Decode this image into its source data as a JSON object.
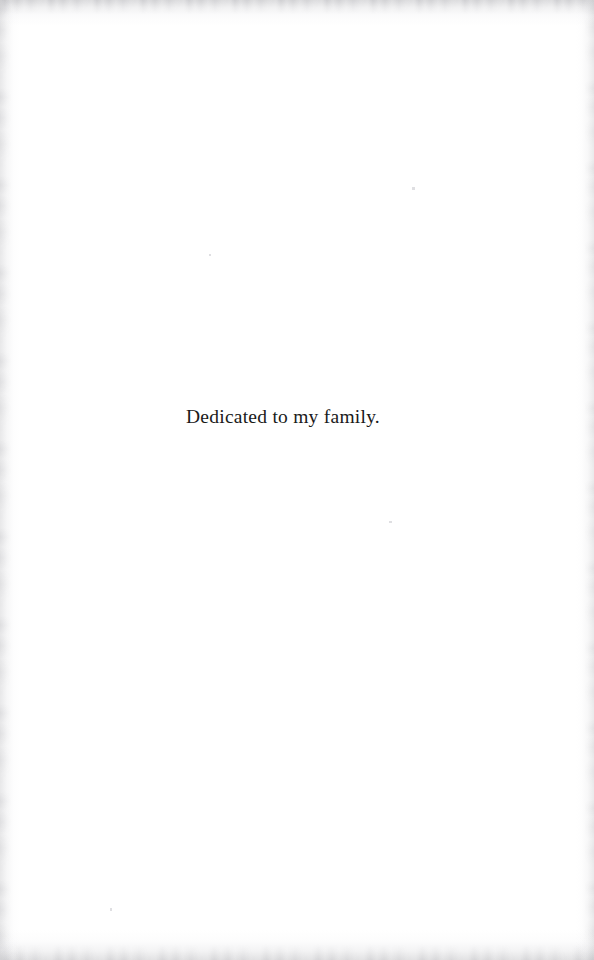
{
  "document": {
    "page_type": "dedication-page",
    "page_width": 594,
    "page_height": 960,
    "background_color": "#ffffff",
    "ink_color": "#1a1a1a"
  },
  "dedication": {
    "text": "Dedicated to my family."
  },
  "scan_artifacts": {
    "edge_shadow_color": "#8e8e94",
    "top_edge": "mottled-grey-band",
    "bottom_edge": "mottled-grey-band",
    "left_edge": "soft-grey-gradient",
    "right_edge": "soft-grey-gradient"
  }
}
